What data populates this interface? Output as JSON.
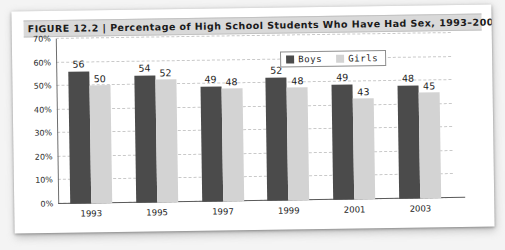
{
  "figure": {
    "title": "FIGURE 12.2  |  Percentage of High School Students Who Have Had Sex, 1993–2003"
  },
  "legend": {
    "boys_label": "Boys",
    "girls_label": "Girls"
  },
  "colors": {
    "boys": "#4b4b4b",
    "girls": "#d3d3d3",
    "title_bar": "#d9d9d9",
    "gridline": "#c9c9c9",
    "axis": "#5a5a5a",
    "card": "#ffffff",
    "page_background": "#f4f4f4"
  },
  "chart_data": {
    "type": "bar",
    "title": "FIGURE 12.2  |  Percentage of High School Students Who Have Had Sex, 1993–2003",
    "xlabel": "",
    "ylabel": "",
    "categories": [
      "1993",
      "1995",
      "1997",
      "1999",
      "2001",
      "2003"
    ],
    "series": [
      {
        "name": "Boys",
        "color": "#4b4b4b",
        "values": [
          56,
          54,
          49,
          52,
          49,
          48
        ]
      },
      {
        "name": "Girls",
        "color": "#d3d3d3",
        "values": [
          50,
          52,
          48,
          48,
          43,
          45
        ]
      }
    ],
    "ylim": [
      0,
      70
    ],
    "yticks": [
      0,
      10,
      20,
      30,
      40,
      50,
      60,
      70
    ],
    "ytick_labels": [
      "0%",
      "10%",
      "20%",
      "30%",
      "40%",
      "50%",
      "60%",
      "70%"
    ],
    "grid": true,
    "grid_style": "dashed-horizontal",
    "legend_position": "top-right",
    "data_labels": true
  }
}
